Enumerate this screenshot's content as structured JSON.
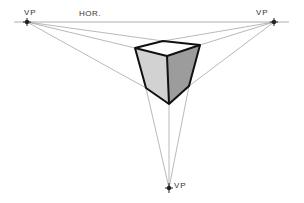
{
  "diagram": {
    "labels": {
      "vp_left": "VP",
      "horizon": "HOR.",
      "vp_right": "VP",
      "vp_bottom": "VP"
    },
    "colors": {
      "background": "#ffffff",
      "guide_line": "#8a8a8a",
      "horizon_line": "#9a9a9a",
      "cube_edge": "#111111",
      "top_face": "#ffffff",
      "left_face": "#d2d2d2",
      "right_face": "#9c9c9c",
      "vanishing_point": "#222222"
    },
    "vanishing_points": {
      "left": [
        27,
        22
      ],
      "right": [
        274,
        22
      ],
      "bottom": [
        169,
        188
      ]
    },
    "horizon": {
      "y": 22,
      "x_start": 14,
      "x_end": 289
    },
    "cube": {
      "top_back": [
        163,
        41
      ],
      "top_left": [
        135,
        48
      ],
      "top_front": [
        167,
        56
      ],
      "top_right": [
        200,
        45
      ],
      "bottom_left": [
        146,
        88
      ],
      "bottom_front": [
        169,
        104
      ],
      "bottom_right": [
        189,
        86
      ]
    }
  }
}
